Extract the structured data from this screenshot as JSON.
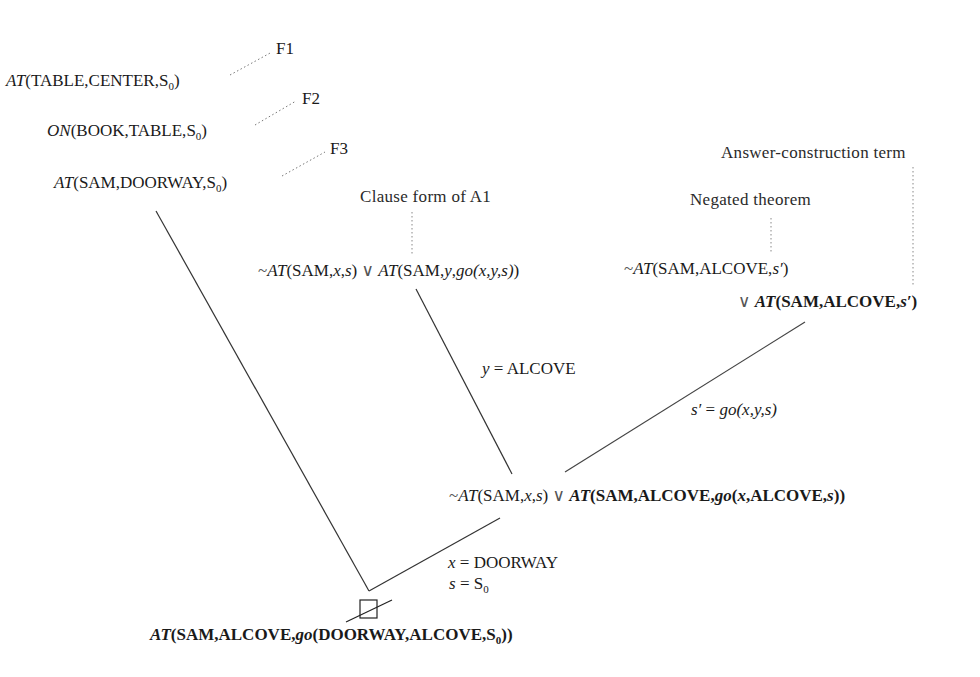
{
  "diagram": {
    "type": "resolution-refutation-tree",
    "facts": [
      {
        "label": "F1",
        "pred": "AT",
        "args": "TABLE,CENTER,",
        "sub_base": "S",
        "sub": "0"
      },
      {
        "label": "F2",
        "pred": "ON",
        "args": "BOOK,TABLE,",
        "sub_base": "S",
        "sub": "0"
      },
      {
        "label": "F3",
        "pred": "AT",
        "args": "SAM,DOORWAY,",
        "sub_base": "S",
        "sub": "0"
      }
    ],
    "annotations": {
      "clause_form": "Clause form of A1",
      "negated_theorem": "Negated theorem",
      "answer_term": "Answer-construction term"
    },
    "clause_a1": {
      "neg": "~",
      "lit1_pred": "AT",
      "lit1_args_open": "(SAM,",
      "lit1_x": "x",
      "lit1_comma": ",",
      "lit1_s": "s",
      "lit1_close": ")",
      "or": "∨",
      "lit2_pred": "AT",
      "lit2_open": "(SAM,",
      "lit2_y": "y",
      "lit2_comma": ",",
      "lit2_fn": "go",
      "lit2_fn_args": "(x,y,s)",
      "lit2_close": ")"
    },
    "negated": {
      "neg": "~",
      "pred": "AT",
      "args": "(SAM,ALCOVE,",
      "var": "s′",
      "close": ")",
      "or": "∨",
      "ans_pred": "AT",
      "ans_args": "(SAM,ALCOVE,",
      "ans_var": "s′",
      "ans_close": ")"
    },
    "substitutions": {
      "y": {
        "var": "y",
        "eq": " = ",
        "val": "ALCOVE"
      },
      "s_prime": {
        "var": "s′",
        "eq": " = ",
        "fn": "go",
        "args": "(x,y,s)"
      },
      "x": {
        "var": "x",
        "eq": " = ",
        "val": "DOORWAY"
      },
      "s": {
        "var": "s",
        "eq": " = ",
        "val_base": "S",
        "val_sub": "0"
      }
    },
    "resolvent": {
      "neg": "~",
      "pred": "AT",
      "args_open": "(SAM,",
      "x": "x",
      "comma": ",",
      "s": "s",
      "close": ")",
      "or": "∨",
      "ans_pred": "AT",
      "ans_open": "(SAM,ALCOVE,",
      "ans_fn": "go",
      "ans_paren": "(",
      "ans_x": "x",
      "ans_mid": ",ALCOVE,",
      "ans_s": "s",
      "ans_close": "))"
    },
    "empty_clause_symbol": "□",
    "answer": {
      "pred": "AT",
      "open": "(SAM,ALCOVE,",
      "fn": "go",
      "args": "(DOORWAY,ALCOVE,",
      "sub_base": "S",
      "sub": "0",
      "close": "))"
    }
  }
}
